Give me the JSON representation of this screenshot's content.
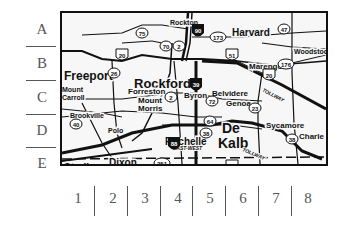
{
  "row_labels": [
    "A",
    "B",
    "C",
    "D",
    "E"
  ],
  "column_labels": [
    "1",
    "2",
    "3",
    "4",
    "5",
    "6",
    "7",
    "8"
  ],
  "map": {
    "cities": [
      {
        "name": "Rockton",
        "x": 108,
        "y": 5,
        "size": 7
      },
      {
        "name": "Harvard",
        "x": 170,
        "y": 13,
        "size": 10
      },
      {
        "name": "Woodstock",
        "x": 232,
        "y": 34,
        "size": 7
      },
      {
        "name": "Freeport",
        "x": 2,
        "y": 55,
        "size": 12
      },
      {
        "name": "Rockford",
        "x": 72,
        "y": 62,
        "size": 13
      },
      {
        "name": "Marengo",
        "x": 187,
        "y": 48,
        "size": 8
      },
      {
        "name": "Forreston",
        "x": 66,
        "y": 73,
        "size": 8
      },
      {
        "name": "Byron",
        "x": 122,
        "y": 77,
        "size": 8
      },
      {
        "name": "Belvidere",
        "x": 150,
        "y": 75,
        "size": 8
      },
      {
        "name": "Genoa",
        "x": 164,
        "y": 85,
        "size": 8
      },
      {
        "name": "Mount",
        "x": 0,
        "y": 72,
        "size": 7
      },
      {
        "name": "Carroll",
        "x": 0,
        "y": 80,
        "size": 7
      },
      {
        "name": "Mount",
        "x": 76,
        "y": 82,
        "size": 8
      },
      {
        "name": "Morris",
        "x": 76,
        "y": 90,
        "size": 8
      },
      {
        "name": "Brookville",
        "x": 8,
        "y": 98,
        "size": 7
      },
      {
        "name": "Polo",
        "x": 46,
        "y": 113,
        "size": 7
      },
      {
        "name": "Rochelle",
        "x": 103,
        "y": 122,
        "size": 10
      },
      {
        "name": "De",
        "x": 160,
        "y": 106,
        "size": 14
      },
      {
        "name": "Kalb",
        "x": 156,
        "y": 121,
        "size": 14
      },
      {
        "name": "Sycamore",
        "x": 204,
        "y": 107,
        "size": 8
      },
      {
        "name": "Charle",
        "x": 237,
        "y": 118,
        "size": 8
      },
      {
        "name": "Sterling",
        "x": 2,
        "y": 148,
        "size": 10
      },
      {
        "name": "Dixon",
        "x": 47,
        "y": 143,
        "size": 10
      }
    ],
    "road_labels": [
      {
        "text": "TOLLWAY",
        "x": 200,
        "y": 78,
        "rotate": 28
      },
      {
        "text": "EAST-WEST",
        "x": 111,
        "y": 137,
        "rotate": 0
      },
      {
        "text": "TOLLWAY",
        "x": 180,
        "y": 138,
        "rotate": 22
      }
    ],
    "route_shields": [
      {
        "num": "75",
        "x": 80,
        "y": 20,
        "type": "state"
      },
      {
        "num": "173",
        "x": 156,
        "y": 24,
        "type": "state"
      },
      {
        "num": "47",
        "x": 222,
        "y": 16,
        "type": "state"
      },
      {
        "num": "70",
        "x": 104,
        "y": 33,
        "type": "state"
      },
      {
        "num": "2",
        "x": 117,
        "y": 33,
        "type": "state"
      },
      {
        "num": "20",
        "x": 60,
        "y": 42,
        "type": "us"
      },
      {
        "num": "26",
        "x": 52,
        "y": 60,
        "type": "state"
      },
      {
        "num": "2",
        "x": 109,
        "y": 84,
        "type": "state"
      },
      {
        "num": "51",
        "x": 170,
        "y": 42,
        "type": "us"
      },
      {
        "num": "176",
        "x": 224,
        "y": 51,
        "type": "state"
      },
      {
        "num": "20",
        "x": 207,
        "y": 62,
        "type": "us"
      },
      {
        "num": "72",
        "x": 150,
        "y": 88,
        "type": "state"
      },
      {
        "num": "23",
        "x": 193,
        "y": 95,
        "type": "state"
      },
      {
        "num": "64",
        "x": 148,
        "y": 108,
        "type": "state"
      },
      {
        "num": "38",
        "x": 144,
        "y": 120,
        "type": "state"
      },
      {
        "num": "38",
        "x": 230,
        "y": 126,
        "type": "state"
      },
      {
        "num": "40",
        "x": 14,
        "y": 111,
        "type": "state"
      },
      {
        "num": "251",
        "x": 100,
        "y": 150,
        "type": "state"
      },
      {
        "num": "30",
        "x": 170,
        "y": 153,
        "type": "us"
      }
    ],
    "interstate_shields": [
      {
        "num": "90",
        "x": 136,
        "y": 18
      },
      {
        "num": "39",
        "x": 134,
        "y": 72
      },
      {
        "num": "88",
        "x": 112,
        "y": 131
      }
    ]
  }
}
